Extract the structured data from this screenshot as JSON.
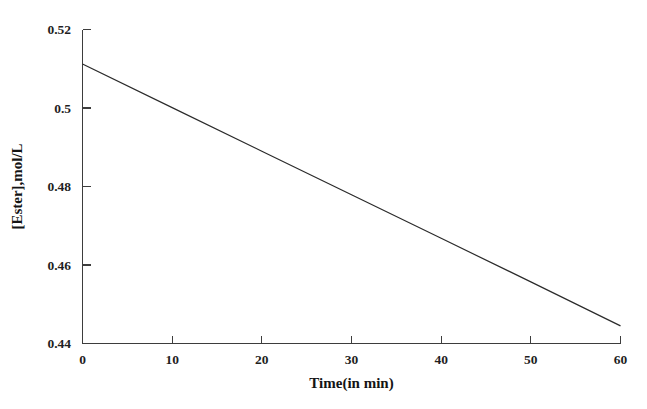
{
  "chart_data": {
    "type": "line",
    "title": "",
    "subtitle": "",
    "xlabel": "Time(in min)",
    "ylabel": "[Ester],mol/L",
    "xlim": [
      0,
      60
    ],
    "ylim": [
      0.44,
      0.52
    ],
    "xticks": [
      0,
      10,
      20,
      30,
      40,
      50,
      60
    ],
    "xtick_labels": [
      "0",
      "10",
      "20",
      "30",
      "40",
      "50",
      "60"
    ],
    "yticks": [
      0.44,
      0.46,
      0.48,
      0.5,
      0.52
    ],
    "ytick_labels": [
      "0.44",
      "0.46",
      "0.48",
      "0.5",
      "0.52"
    ],
    "grid": false,
    "legend": false,
    "legend_position": "none",
    "series": [
      {
        "name": "[Ester]",
        "color": "#2b2b2b",
        "x": [
          0,
          10,
          20,
          30,
          40,
          50,
          60
        ],
        "values": [
          0.5112,
          0.5001,
          0.489,
          0.4779,
          0.4668,
          0.4557,
          0.4445
        ]
      }
    ],
    "annotations": []
  },
  "axes": {
    "x_title": "Time(in min)",
    "y_title": "[Ester],mol/L"
  }
}
